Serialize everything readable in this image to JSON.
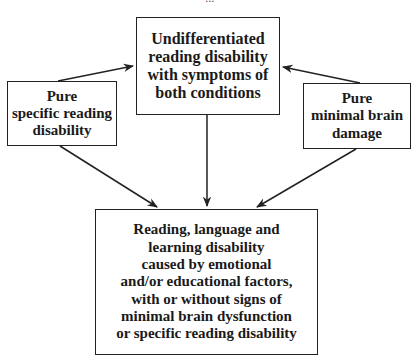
{
  "diagram": {
    "caption_fragment": "...",
    "nodes": {
      "top": {
        "label": "Undifferentiated\nreading disability\nwith symptoms of\nboth conditions"
      },
      "left": {
        "label": "Pure\nspecific reading\ndisability"
      },
      "right": {
        "label": "Pure\nminimal brain\ndamage"
      },
      "bottom": {
        "label": "Reading, language and\nlearning disability\ncaused by emotional\nand/or educational factors,\nwith or without signs of\nminimal brain dysfunction\nor specific reading disability"
      }
    },
    "edges": [
      {
        "from": "left",
        "to": "top"
      },
      {
        "from": "right",
        "to": "top"
      },
      {
        "from": "left",
        "to": "bottom"
      },
      {
        "from": "top",
        "to": "bottom"
      },
      {
        "from": "right",
        "to": "bottom"
      }
    ],
    "colors": {
      "line": "#222222",
      "background": "#ffffff",
      "text": "#1a1a1a"
    }
  }
}
